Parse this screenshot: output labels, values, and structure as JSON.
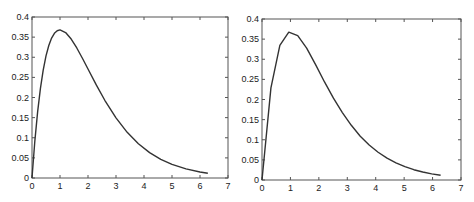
{
  "colors": {
    "line": "#333333",
    "axis": "#555555",
    "text": "#222222",
    "background": "#ffffff"
  },
  "chart_data": [
    {
      "type": "line",
      "title": "",
      "xlabel": "",
      "ylabel": "",
      "xlim": [
        0,
        7
      ],
      "ylim": [
        0,
        0.4
      ],
      "grid": false,
      "xticks": [
        "0",
        "1",
        "2",
        "3",
        "4",
        "5",
        "6",
        "7"
      ],
      "yticks": [
        "0",
        "0.05",
        "0.1",
        "0.15",
        "0.2",
        "0.25",
        "0.3",
        "0.35",
        "0.4"
      ],
      "series": [
        {
          "name": "x*exp(-x) (smooth)",
          "x": [
            0,
            0.1,
            0.2,
            0.3,
            0.4,
            0.5,
            0.6,
            0.7,
            0.8,
            0.9,
            1.0,
            1.2,
            1.4,
            1.6,
            1.8,
            2.0,
            2.3,
            2.6,
            3.0,
            3.4,
            3.8,
            4.2,
            4.6,
            5.0,
            5.5,
            6.0,
            6.28
          ],
          "y": [
            0,
            0.0905,
            0.1637,
            0.2222,
            0.2681,
            0.3033,
            0.3293,
            0.3476,
            0.3595,
            0.3659,
            0.3679,
            0.3614,
            0.3452,
            0.323,
            0.2975,
            0.2707,
            0.2306,
            0.1931,
            0.1494,
            0.1135,
            0.0851,
            0.063,
            0.0462,
            0.0337,
            0.0225,
            0.0149,
            0.0117
          ]
        }
      ]
    },
    {
      "type": "line",
      "title": "",
      "xlabel": "",
      "ylabel": "",
      "xlim": [
        0,
        7
      ],
      "ylim": [
        0,
        0.4
      ],
      "grid": false,
      "xticks": [
        "0",
        "1",
        "2",
        "3",
        "4",
        "5",
        "6",
        "7"
      ],
      "yticks": [
        "0",
        "0.05",
        "0.1",
        "0.15",
        "0.2",
        "0.25",
        "0.3",
        "0.35",
        "0.4"
      ],
      "series": [
        {
          "name": "x*exp(-x) (sampled, step pi/10)",
          "x": [
            0,
            0.314,
            0.628,
            0.942,
            1.257,
            1.571,
            1.885,
            2.199,
            2.513,
            2.827,
            3.142,
            3.456,
            3.77,
            4.084,
            4.398,
            4.712,
            5.027,
            5.341,
            5.655,
            5.969,
            6.283
          ],
          "y": [
            0,
            0.229,
            0.3345,
            0.3673,
            0.3585,
            0.3277,
            0.2866,
            0.2436,
            0.2034,
            0.1676,
            0.1359,
            0.1088,
            0.0869,
            0.0689,
            0.0542,
            0.0424,
            0.0331,
            0.0256,
            0.0198,
            0.0153,
            0.0117
          ]
        }
      ]
    }
  ]
}
